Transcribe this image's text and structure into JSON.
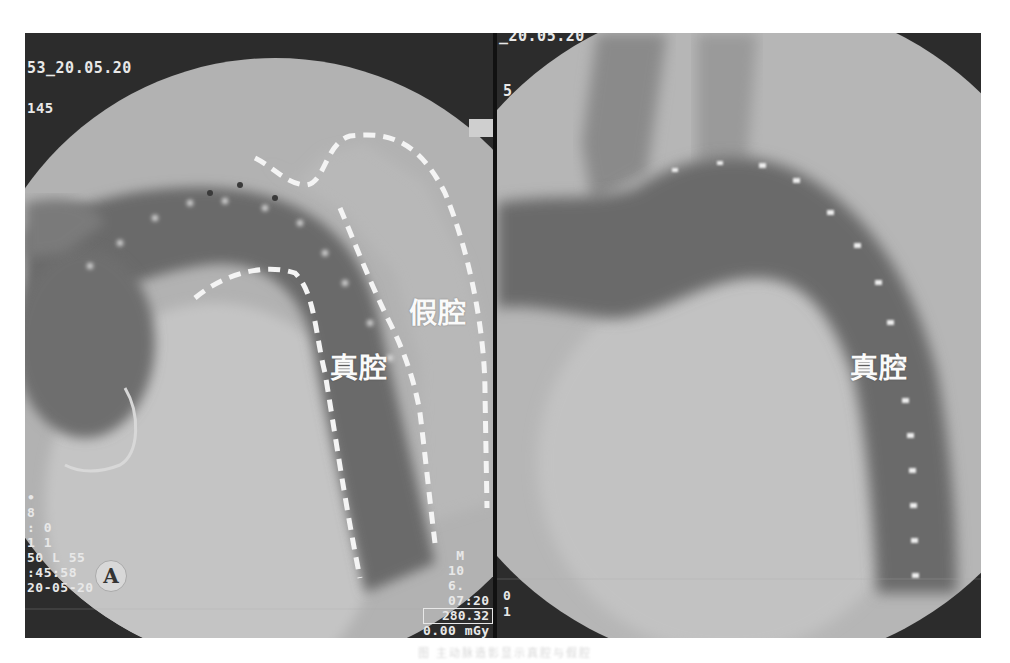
{
  "figure": {
    "left_panel": {
      "overlay_top": {
        "line1": "53_20.05.20",
        "line2": "145"
      },
      "overlay_bottom_left": {
        "line1": "•",
        "line2": "8",
        "line3": ": 0",
        "line4": "1 1",
        "line5": "50 L 55",
        "line6": ":45:58",
        "line7": "20-05-20"
      },
      "overlay_bottom_right": {
        "line1": "M",
        "line2": "10",
        "line3": "6.",
        "line4": "07:20",
        "dose_box": "280.32",
        "dose_unit": "0.00 mGy"
      },
      "logo_glyph": "A",
      "labels": {
        "true_lumen": "真腔",
        "false_lumen": "假腔"
      }
    },
    "right_panel": {
      "overlay_top": {
        "line1": "_20.05.20",
        "line2": "5"
      },
      "overlay_bottom_left": {
        "line1": "0",
        "line2": "1"
      },
      "labels": {
        "true_lumen": "真腔"
      }
    },
    "colors": {
      "background_dark": "#2a2a2a",
      "field_light": "#b4b4b4",
      "vessel_dark": "#6a6a6a",
      "dash_white": "#f2f2f2"
    }
  },
  "caption": "图 主动脉造影显示真腔与假腔"
}
